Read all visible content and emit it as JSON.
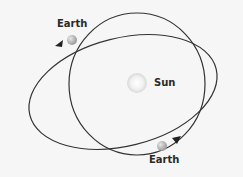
{
  "diagram": {
    "title": "",
    "labels": {
      "sun": "Sun",
      "earth_top": "Earth",
      "earth_bottom": "Earth"
    },
    "colors": {
      "background": "#f6f6f6",
      "orbit_stroke": "#333333",
      "sun_fill": "#ececec",
      "earth_fill": "#b5b5b5",
      "text": "#2a2a2a"
    },
    "elements": [
      {
        "id": "circular-orbit",
        "type": "ellipse",
        "description": "near-circular orbit centered on the Sun"
      },
      {
        "id": "elliptical-orbit",
        "type": "ellipse",
        "description": "tilted elongated elliptical orbit"
      },
      {
        "id": "sun",
        "type": "circle",
        "label": "Sun"
      },
      {
        "id": "earth-top",
        "type": "circle",
        "label": "Earth",
        "direction": "arrow pointing left along ellipse"
      },
      {
        "id": "earth-bottom",
        "type": "circle",
        "label": "Earth",
        "direction": "arrow pointing up-right along ellipse"
      }
    ]
  }
}
